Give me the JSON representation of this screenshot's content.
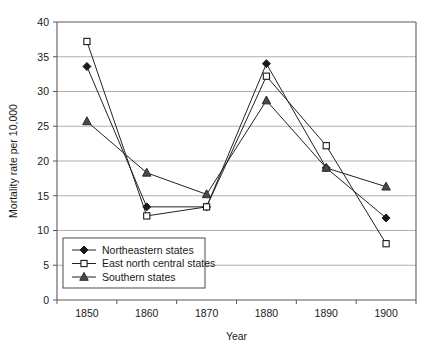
{
  "chart_data": {
    "type": "line",
    "title": "",
    "xlabel": "Year",
    "ylabel": "Mortality rate per 10,000",
    "categories": [
      "1850",
      "1860",
      "1870",
      "1880",
      "1890",
      "1900"
    ],
    "x": [
      1850,
      1860,
      1870,
      1880,
      1890,
      1900
    ],
    "ylim": [
      0,
      40
    ],
    "yticks": [
      "0",
      "5",
      "10",
      "15",
      "20",
      "25",
      "30",
      "35",
      "40"
    ],
    "ytick_values": [
      0,
      5,
      10,
      15,
      20,
      25,
      30,
      35,
      40
    ],
    "grid": true,
    "legend_position": "lower-left-inside",
    "series": [
      {
        "name": "Northeastern states",
        "marker": "filled-diamond",
        "values": [
          33.6,
          13.4,
          13.4,
          34.0,
          19.0,
          11.8
        ]
      },
      {
        "name": "East north central states",
        "marker": "open-square",
        "values": [
          37.2,
          12.1,
          13.4,
          32.2,
          22.2,
          8.1
        ]
      },
      {
        "name": "Southern states",
        "marker": "filled-triangle",
        "values": [
          25.7,
          18.3,
          15.2,
          28.7,
          19.0,
          16.3
        ]
      }
    ]
  },
  "colors": {
    "line": "#222222",
    "grid": "#9a9a9a",
    "axis": "#5a5a5a",
    "text": "#1a1a1a",
    "background": "#ffffff"
  },
  "legend": {
    "entries": [
      {
        "label": "Northeastern states"
      },
      {
        "label": "East north central states"
      },
      {
        "label": "Southern states"
      }
    ]
  }
}
